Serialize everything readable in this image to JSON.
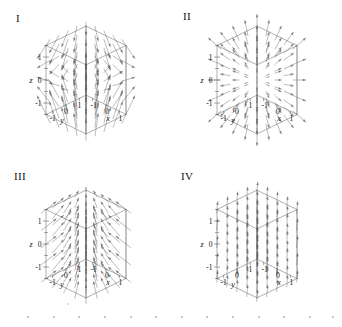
{
  "figure": {
    "type": "vector-field-panel-grid",
    "rows": 2,
    "columns": 2,
    "background": "#ffffff",
    "ink_color": "#6e6e6e",
    "axis_color": "#555555",
    "text_color": "#111111"
  },
  "axes": {
    "x_label": "x",
    "y_label": "y",
    "z_label": "z",
    "x_ticks": [
      "1",
      "0",
      "-1"
    ],
    "y_ticks": [
      "-1",
      "0",
      "1"
    ],
    "z_ticks": [
      "1",
      "0",
      "-1"
    ],
    "x_range": [
      -1.5,
      1.5
    ],
    "y_range": [
      -1.5,
      1.5
    ],
    "z_range": [
      -1.5,
      1.5
    ]
  },
  "panels": [
    {
      "label": "I",
      "field_name": "saddle-field",
      "description": "Arrows sweep outward from a horizontal mid-plane, diverging upward above it and downward below it, producing a saddle / hyperbolic pattern.",
      "pattern": "saddle"
    },
    {
      "label": "II",
      "field_name": "radial-source-field",
      "description": "Arrows radiate outward in all directions from the centre of the box, a radial source field.",
      "pattern": "radial"
    },
    {
      "label": "III",
      "field_name": "converging-upward-field",
      "description": "Arrows point upward while converging horizontally toward the central vertical axis.",
      "pattern": "converging-up"
    },
    {
      "label": "IV",
      "field_name": "uniform-field",
      "description": "All arrows are parallel and of equal length, pointing up and to the right: a constant uniform field.",
      "pattern": "uniform"
    }
  ],
  "chart_data": {
    "type": "scatter",
    "title": "",
    "xlabel": "x",
    "ylabel": "y",
    "zlabel": "z",
    "xlim": [
      -1.5,
      1.5
    ],
    "ylim": [
      -1.5,
      1.5
    ],
    "zlim": [
      -1.5,
      1.5
    ],
    "grid": false,
    "legend": "none",
    "panels": [
      {
        "label": "I",
        "pattern": "saddle",
        "vector_formula": "F = (x, y, -2z) style saddle",
        "sample_points": [
          {
            "x": -1,
            "y": -1,
            "z": 1,
            "u": -1,
            "v": -1,
            "w": 1
          },
          {
            "x": 0,
            "y": 0,
            "z": 1,
            "u": 0,
            "v": 0,
            "w": 1
          },
          {
            "x": 1,
            "y": 1,
            "z": 1,
            "u": 1,
            "v": 1,
            "w": 1
          },
          {
            "x": -1,
            "y": -1,
            "z": 0,
            "u": -1,
            "v": -1,
            "w": 0
          },
          {
            "x": 1,
            "y": 1,
            "z": 0,
            "u": 1,
            "v": 1,
            "w": 0
          },
          {
            "x": -1,
            "y": -1,
            "z": -1,
            "u": -1,
            "v": -1,
            "w": -1
          },
          {
            "x": 1,
            "y": 1,
            "z": -1,
            "u": 1,
            "v": 1,
            "w": -1
          }
        ]
      },
      {
        "label": "II",
        "pattern": "radial",
        "vector_formula": "F = (x, y, z)",
        "sample_points": [
          {
            "x": -1,
            "y": -1,
            "z": -1,
            "u": -1,
            "v": -1,
            "w": -1
          },
          {
            "x": 0,
            "y": 0,
            "z": 1,
            "u": 0,
            "v": 0,
            "w": 1
          },
          {
            "x": 1,
            "y": 1,
            "z": 1,
            "u": 1,
            "v": 1,
            "w": 1
          },
          {
            "x": -1,
            "y": 1,
            "z": 0,
            "u": -1,
            "v": 1,
            "w": 0
          },
          {
            "x": 1,
            "y": -1,
            "z": 0,
            "u": 1,
            "v": -1,
            "w": 0
          }
        ]
      },
      {
        "label": "III",
        "pattern": "converging-up",
        "vector_formula": "F = (-x, -y, 1)",
        "sample_points": [
          {
            "x": -1,
            "y": -1,
            "z": 0,
            "u": 1,
            "v": 1,
            "w": 1
          },
          {
            "x": 1,
            "y": 1,
            "z": 0,
            "u": -1,
            "v": -1,
            "w": 1
          },
          {
            "x": 0,
            "y": 0,
            "z": 0,
            "u": 0,
            "v": 0,
            "w": 1
          },
          {
            "x": -1,
            "y": 1,
            "z": 0,
            "u": 1,
            "v": -1,
            "w": 1
          },
          {
            "x": 1,
            "y": -1,
            "z": 0,
            "u": -1,
            "v": 1,
            "w": 1
          }
        ]
      },
      {
        "label": "IV",
        "pattern": "uniform",
        "vector_formula": "F = (0, 0, 1) constant",
        "sample_points": [
          {
            "x": -1,
            "y": -1,
            "z": -1,
            "u": 0,
            "v": 0,
            "w": 1
          },
          {
            "x": 0,
            "y": 0,
            "z": 0,
            "u": 0,
            "v": 0,
            "w": 1
          },
          {
            "x": 1,
            "y": 1,
            "z": 1,
            "u": 0,
            "v": 0,
            "w": 1
          }
        ]
      }
    ]
  }
}
